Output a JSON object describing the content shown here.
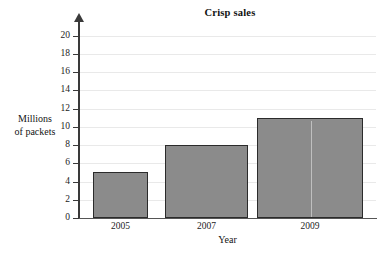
{
  "chart_data": {
    "type": "bar",
    "title": "Crisp sales",
    "xlabel": "Year",
    "ylabel": "Millions of packets",
    "ylabel_lines": [
      "Millions",
      "of packets"
    ],
    "categories": [
      "2005",
      "2007",
      "2009"
    ],
    "values": [
      5,
      8,
      11
    ],
    "ylim": [
      0,
      20
    ],
    "ytick_step": 2,
    "yticks": [
      0,
      2,
      4,
      6,
      8,
      10,
      12,
      14,
      16,
      18,
      20
    ],
    "ytick_labels": [
      "0",
      "2",
      "4",
      "6",
      "8",
      "10",
      "12",
      "14",
      "16",
      "18",
      "20"
    ],
    "grid": true,
    "grid_axis": "y",
    "legend": null,
    "bar_color": "#8b8b8b",
    "bar_edge_color": "#2b2b2b",
    "grid_color": "#e9e9e9",
    "axis_color": "#3a3a3a",
    "y_axis_arrow": true,
    "background": "#ffffff",
    "series": [
      {
        "name": "Crisp sales",
        "values": [
          5,
          8,
          11
        ]
      }
    ],
    "bars": [
      {
        "category": "2005",
        "value": 5
      },
      {
        "category": "2007",
        "value": 8
      },
      {
        "category": "2009",
        "value": 11
      }
    ]
  }
}
